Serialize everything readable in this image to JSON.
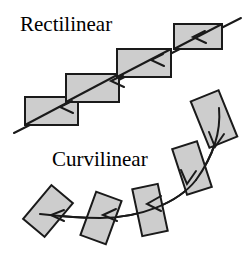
{
  "figure": {
    "width": 247,
    "height": 253,
    "background_color": "#ffffff"
  },
  "labels": {
    "rectilinear": "Rectilinear",
    "curvilinear": "Curvilinear"
  },
  "style": {
    "shape_fill": "#cccccc",
    "shape_stroke": "#1a1a1a",
    "shape_stroke_width": 2,
    "path_stroke": "#1a1a1a",
    "path_stroke_width": 2,
    "label_color": "#000000"
  },
  "diagram_data": {
    "type": "diagram",
    "panels": [
      {
        "name": "rectilinear",
        "label": "Rectilinear",
        "path_kind": "straight-line",
        "path_description": "A single straight diagonal line running from lower-left to upper-right, passing through the corners of each rectangle",
        "path_start": [
          14,
          133
        ],
        "path_end": [
          241,
          18
        ],
        "arrow_direction": "down-left",
        "arrowheads": [
          {
            "at": [
              218,
              34
            ],
            "note": "inside top-right rectangle"
          },
          {
            "at": [
              162,
              63
            ],
            "note": "at left edge of third rectangle"
          },
          {
            "at": [
              110,
              88
            ],
            "note": "at left edge of second rectangle"
          },
          {
            "at": [
              60,
              113
            ],
            "note": "at left edge of first rectangle"
          }
        ],
        "shape_orientation_note": "All rectangles keep the same axis-aligned orientation (0 degrees) as they translate along the line",
        "shapes": [
          {
            "index": 1,
            "cx": 51.5,
            "cy": 111.0,
            "width": 53,
            "height": 28,
            "rotation_deg": 0
          },
          {
            "index": 2,
            "cx": 92.5,
            "cy": 88.0,
            "width": 53,
            "height": 28,
            "rotation_deg": 0
          },
          {
            "index": 3,
            "cx": 144.0,
            "cy": 63.0,
            "width": 53,
            "height": 28,
            "rotation_deg": 0
          },
          {
            "index": 4,
            "cx": 198.0,
            "cy": 36.0,
            "width": 48,
            "height": 25,
            "rotation_deg": 0
          }
        ]
      },
      {
        "name": "curvilinear",
        "label": "Curvilinear",
        "path_kind": "curved-line",
        "path_description": "A smooth curve sweeping from the upper right downward and then leftward, flattening out toward the left",
        "path_start": [
          219,
          108
        ],
        "path_end": [
          37,
          218
        ],
        "arrow_direction": "down-then-left",
        "arrowheads": [
          {
            "at": [
              214,
              145
            ],
            "note": "below first tilted rectangle"
          },
          {
            "at": [
              186,
              182
            ],
            "note": "below second tilted rectangle"
          },
          {
            "at": [
              148,
              204
            ],
            "note": "at third rectangle"
          },
          {
            "at": [
              104,
              215
            ],
            "note": "at fourth rectangle"
          },
          {
            "at": [
              52,
              216
            ],
            "note": "inside leftmost rectangle"
          }
        ],
        "shape_orientation_note": "Each rectangle rotates to stay tangent to the curve, from near-vertical at the start to near-horizontal at the end",
        "shapes": [
          {
            "index": 1,
            "cx": 214.0,
            "cy": 119.0,
            "width": 29,
            "height": 50,
            "rotation_deg": -22
          },
          {
            "index": 2,
            "cx": 192.0,
            "cy": 168.0,
            "width": 26,
            "height": 48,
            "rotation_deg": -18
          },
          {
            "index": 3,
            "cx": 150.0,
            "cy": 210.0,
            "width": 26,
            "height": 48,
            "rotation_deg": -12
          },
          {
            "index": 4,
            "cx": 101.0,
            "cy": 218.0,
            "width": 27,
            "height": 46,
            "rotation_deg": 20
          },
          {
            "index": 5,
            "cx": 48.0,
            "cy": 211.0,
            "width": 28,
            "height": 44,
            "rotation_deg": 40
          }
        ]
      }
    ]
  }
}
